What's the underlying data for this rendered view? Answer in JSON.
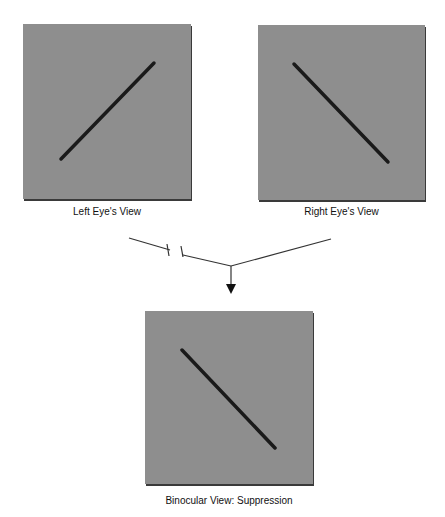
{
  "diagram": {
    "panels": [
      {
        "id": "left",
        "caption": "Left Eye's View",
        "line_orientation": "ascending",
        "background": "#8e8e8e",
        "line_color": "#1a1a1a"
      },
      {
        "id": "right",
        "caption": "Right Eye's View",
        "line_orientation": "descending",
        "background": "#8e8e8e",
        "line_color": "#1a1a1a"
      },
      {
        "id": "binocular",
        "caption": "Binocular View: Suppression",
        "line_orientation": "descending",
        "background": "#8e8e8e",
        "line_color": "#1a1a1a"
      }
    ],
    "connector": {
      "left_arm": "broken",
      "right_arm": "continuous",
      "arrow": "down"
    }
  }
}
